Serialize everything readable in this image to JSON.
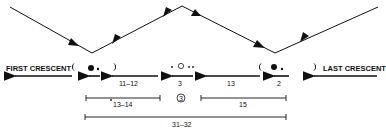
{
  "labels": {
    "first_crescent": "FIRST CRESCENT",
    "last_crescent": "LAST CRESCENT"
  },
  "interval_labels": {
    "a": "11–12",
    "b": "3",
    "c": "13",
    "d": "2"
  },
  "spans": {
    "left": "13–14",
    "center_marker": "3",
    "right": "15",
    "total": "31–32"
  },
  "colors": {
    "ink": "#111111",
    "background": "#ffffff"
  }
}
